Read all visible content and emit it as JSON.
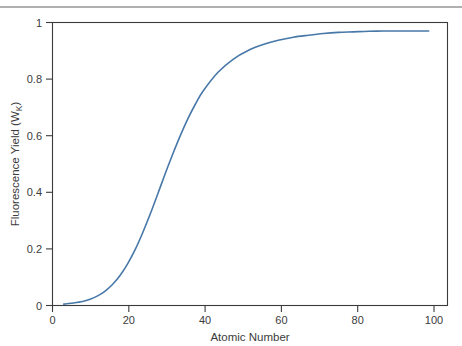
{
  "figure": {
    "background_color": "#ffffff",
    "page_rule_color": "#b0b0b0",
    "axis_color": "#3b3b3b",
    "curve_color": "#4878a8"
  },
  "chart_data": {
    "type": "line",
    "title": "",
    "xlabel": "Atomic Number",
    "ylabel": "Fluorescence Yield (W",
    "ylabel_subscript": "K",
    "ylabel_suffix": ")",
    "xlim": [
      0,
      105
    ],
    "ylim": [
      0,
      1
    ],
    "grid": false,
    "legend": "none",
    "xticks": [
      0,
      20,
      40,
      60,
      80,
      100
    ],
    "xtick_labels": [
      "0",
      "20",
      "40",
      "60",
      "80",
      "100"
    ],
    "yticks": [
      0,
      0.2,
      0.4,
      0.6,
      0.8,
      1
    ],
    "ytick_labels": [
      "0",
      "0.2",
      "0.4",
      "0.6",
      "0.8",
      "1"
    ],
    "series": [
      {
        "name": "K-shell fluorescence yield",
        "color": "#4878a8",
        "line_width": 1.6,
        "x": [
          3,
          5,
          8,
          10,
          12,
          14,
          16,
          18,
          20,
          22,
          24,
          26,
          28,
          30,
          32,
          34,
          36,
          38,
          40,
          44,
          48,
          52,
          56,
          60,
          64,
          68,
          72,
          76,
          80,
          84,
          88,
          92,
          96,
          100
        ],
        "y": [
          0.005,
          0.008,
          0.014,
          0.022,
          0.034,
          0.051,
          0.075,
          0.107,
          0.148,
          0.198,
          0.258,
          0.324,
          0.395,
          0.467,
          0.536,
          0.601,
          0.66,
          0.712,
          0.757,
          0.824,
          0.87,
          0.901,
          0.922,
          0.937,
          0.948,
          0.955,
          0.961,
          0.965,
          0.967,
          0.969,
          0.97,
          0.97,
          0.97,
          0.97
        ]
      }
    ]
  }
}
